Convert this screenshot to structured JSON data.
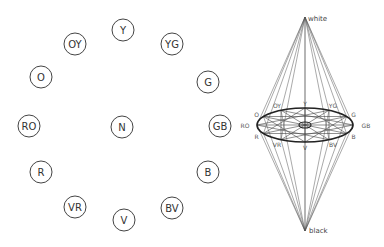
{
  "hue_circle": {
    "nodes": [
      {
        "label": "Y",
        "x": 123,
        "y": 30
      },
      {
        "label": "YG",
        "x": 172,
        "y": 44
      },
      {
        "label": "G",
        "x": 208,
        "y": 82
      },
      {
        "label": "GB",
        "x": 220,
        "y": 126
      },
      {
        "label": "B",
        "x": 208,
        "y": 172
      },
      {
        "label": "BV",
        "x": 172,
        "y": 208
      },
      {
        "label": "V",
        "x": 124,
        "y": 220
      },
      {
        "label": "VR",
        "x": 75,
        "y": 207
      },
      {
        "label": "R",
        "x": 41,
        "y": 172
      },
      {
        "label": "RO",
        "x": 29,
        "y": 126
      },
      {
        "label": "O",
        "x": 41,
        "y": 77
      },
      {
        "label": "OY",
        "x": 75,
        "y": 44
      }
    ],
    "center": {
      "label": "N",
      "x": 122,
      "y": 127
    },
    "radius": 11
  },
  "color_solid": {
    "white_label": "white",
    "black_label": "black",
    "white_apex": {
      "x": 305,
      "y": 17
    },
    "black_apex": {
      "x": 305,
      "y": 231
    },
    "ellipse": {
      "cx": 305,
      "cy": 125,
      "rx": 48,
      "ry": 17
    },
    "center_ellipse": {
      "cx": 305,
      "cy": 125,
      "rx": 6,
      "ry": 3
    },
    "vertex_labels": [
      "Y",
      "YG",
      "G",
      "GB",
      "B",
      "BV",
      "V",
      "VR",
      "R",
      "RO",
      "O",
      "OY"
    ]
  }
}
